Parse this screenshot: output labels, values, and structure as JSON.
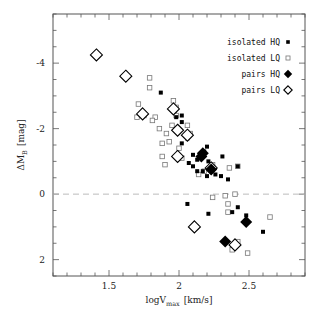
{
  "chart_data": {
    "type": "scatter",
    "title": "",
    "xlabel": "logV_max [km/s]",
    "ylabel": "ΔM_B [mag]",
    "xlim": [
      1.1,
      2.9
    ],
    "ylim": [
      2.5,
      -5.5
    ],
    "y_inverted": true,
    "grid": false,
    "reference_line": {
      "y": 0,
      "style": "dashed",
      "color": "#bbbbbb"
    },
    "xticks": [
      1.5,
      2,
      2.5
    ],
    "xtick_labels": [
      "1.5",
      "2",
      "2.5"
    ],
    "xminor_step": 0.1,
    "yticks": [
      -4,
      -2,
      0,
      2
    ],
    "ytick_labels": [
      "-4",
      "-2",
      "0",
      "2"
    ],
    "yminor_step": 0.5,
    "legend_position": "upper right",
    "series": [
      {
        "name": "isolated HQ",
        "marker": "filled-square",
        "color": "#000000",
        "points": [
          [
            1.87,
            -3.1
          ],
          [
            1.97,
            -2.55
          ],
          [
            1.98,
            -2.35
          ],
          [
            2.02,
            -2.2
          ],
          [
            2.02,
            -2.4
          ],
          [
            1.99,
            -1.9
          ],
          [
            2.07,
            -1.8
          ],
          [
            2.06,
            -1.7
          ],
          [
            2.02,
            -1.55
          ],
          [
            2.2,
            -1.45
          ],
          [
            2.1,
            -1.2
          ],
          [
            2.13,
            -1.05
          ],
          [
            2.07,
            -0.95
          ],
          [
            2.18,
            -1.3
          ],
          [
            2.21,
            -1.0
          ],
          [
            2.31,
            -1.15
          ],
          [
            2.22,
            -0.8
          ],
          [
            2.17,
            -0.7
          ],
          [
            2.26,
            -0.6
          ],
          [
            2.3,
            -0.55
          ],
          [
            2.2,
            -0.55
          ],
          [
            2.35,
            -0.45
          ],
          [
            2.42,
            -0.85
          ],
          [
            2.1,
            -0.85
          ],
          [
            2.13,
            -0.7
          ],
          [
            2.06,
            0.3
          ],
          [
            2.21,
            0.6
          ],
          [
            2.38,
            0.55
          ],
          [
            2.42,
            0.4
          ],
          [
            2.48,
            0.65
          ],
          [
            2.6,
            1.15
          ]
        ]
      },
      {
        "name": "isolated LQ",
        "marker": "open-square",
        "color": "#777777",
        "points": [
          [
            1.71,
            -2.75
          ],
          [
            1.79,
            -3.25
          ],
          [
            1.79,
            -3.55
          ],
          [
            1.83,
            -2.35
          ],
          [
            1.81,
            -2.25
          ],
          [
            1.7,
            -2.35
          ],
          [
            1.75,
            -2.4
          ],
          [
            1.86,
            -2.0
          ],
          [
            1.91,
            -1.85
          ],
          [
            1.98,
            -2.4
          ],
          [
            1.93,
            -1.6
          ],
          [
            1.96,
            -2.85
          ],
          [
            1.96,
            -2.6
          ],
          [
            2.0,
            -1.4
          ],
          [
            1.88,
            -1.15
          ],
          [
            1.9,
            -0.9
          ],
          [
            1.95,
            -2.1
          ],
          [
            1.98,
            -2.65
          ],
          [
            2.06,
            -2.1
          ],
          [
            2.08,
            -1.85
          ],
          [
            1.88,
            -1.55
          ],
          [
            2.02,
            -1.1
          ],
          [
            2.24,
            -0.9
          ],
          [
            2.42,
            -0.85
          ],
          [
            2.36,
            -0.8
          ],
          [
            2.14,
            -0.6
          ],
          [
            2.18,
            -0.7
          ],
          [
            2.24,
            0.1
          ],
          [
            2.35,
            0.3
          ],
          [
            2.4,
            0.0
          ],
          [
            2.35,
            0.55
          ],
          [
            2.33,
            0.05
          ],
          [
            2.65,
            0.7
          ],
          [
            2.12,
            1.0
          ],
          [
            2.38,
            1.7
          ],
          [
            2.49,
            1.8
          ],
          [
            2.42,
            1.45
          ]
        ]
      },
      {
        "name": "pairs HQ",
        "marker": "filled-diamond",
        "color": "#000000",
        "points": [
          [
            2.16,
            -1.15
          ],
          [
            2.17,
            -1.25
          ],
          [
            2.23,
            -0.75
          ],
          [
            2.48,
            0.85
          ],
          [
            2.33,
            1.45
          ]
        ]
      },
      {
        "name": "pairs LQ",
        "marker": "open-diamond",
        "color": "#000000",
        "points": [
          [
            1.41,
            -4.25
          ],
          [
            1.62,
            -3.6
          ],
          [
            1.74,
            -2.45
          ],
          [
            1.96,
            -2.6
          ],
          [
            1.99,
            -1.95
          ],
          [
            1.99,
            -1.15
          ],
          [
            2.23,
            -0.8
          ],
          [
            2.11,
            1.0
          ],
          [
            2.4,
            1.55
          ],
          [
            2.06,
            -1.8
          ]
        ]
      }
    ]
  },
  "legend": {
    "items": [
      {
        "label": "isolated HQ",
        "marker": "filled-square"
      },
      {
        "label": "isolated LQ",
        "marker": "open-square"
      },
      {
        "label": "pairs HQ",
        "marker": "filled-diamond"
      },
      {
        "label": "pairs LQ",
        "marker": "open-diamond"
      }
    ]
  },
  "axes": {
    "xlabel_main": "logV",
    "xlabel_sub": "max",
    "xlabel_unit": "[km/s]",
    "ylabel_main": "ΔM",
    "ylabel_sub": "B",
    "ylabel_unit": "[mag]"
  }
}
